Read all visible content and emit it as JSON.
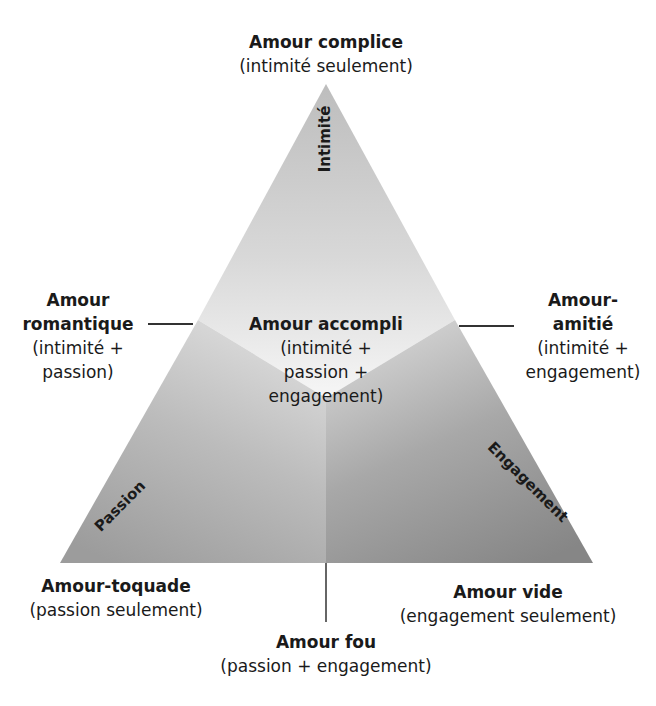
{
  "diagram": {
    "type": "triangular love theory",
    "components": {
      "top": "Intimité",
      "left": "Passion",
      "right": "Engagement"
    },
    "labels": {
      "top": {
        "title": "Amour complice",
        "sub": "(intimité seulement)"
      },
      "left_mid": {
        "title_l1": "Amour",
        "title_l2": "romantique",
        "sub_l1": "(intimité +",
        "sub_l2": "passion)"
      },
      "right_mid": {
        "title_l1": "Amour-",
        "title_l2": "amitié",
        "sub_l1": "(intimité +",
        "sub_l2": "engagement)"
      },
      "center": {
        "title": "Amour accompli",
        "sub_l1": "(intimité +",
        "sub_l2": "passion +",
        "sub_l3": "engagement)"
      },
      "bottom_left": {
        "title": "Amour-toquade",
        "sub": "(passion seulement)"
      },
      "bottom_right": {
        "title": "Amour vide",
        "sub": "(engagement seulement)"
      },
      "bottom_center": {
        "title": "Amour fou",
        "sub": "(passion + engagement)"
      }
    },
    "colors": {
      "top_region_light": "#f4f4f4",
      "top_region_dark": "#c4c4c4",
      "left_region": "#a9a9a9",
      "right_region": "#8e8e8e",
      "line": "#333333",
      "text": "#1a1a1a"
    }
  }
}
